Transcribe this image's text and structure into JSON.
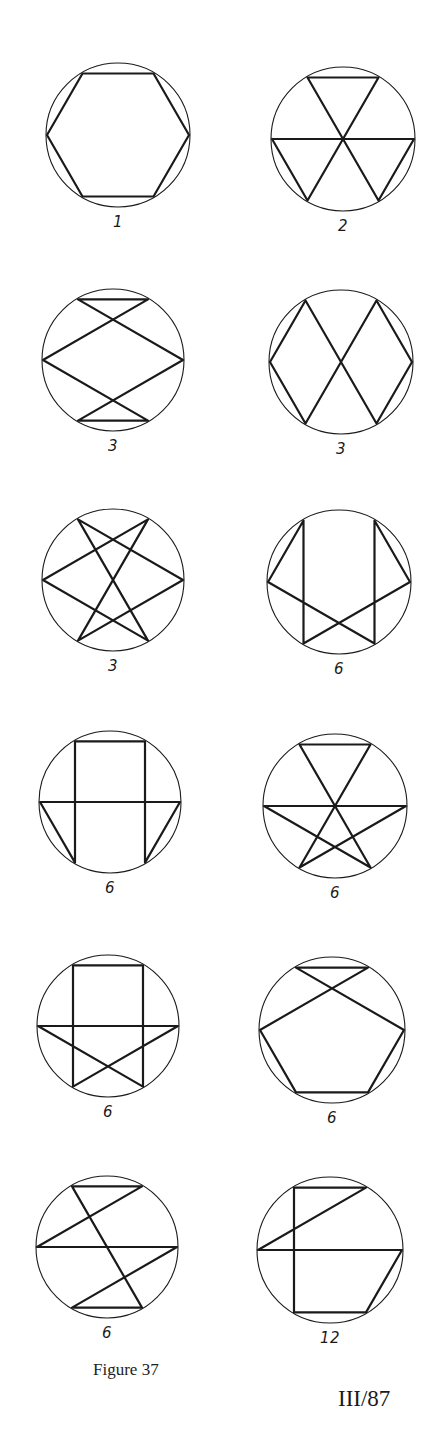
{
  "figure": {
    "caption": "Figure 37",
    "page_number": "III/87",
    "line_color": "#1a1a1a",
    "vertex_convention": "Vertices of inscribed regular hexagon: 0=right, 1=top-right, 2=top-left, 3=left, 4=bottom-left, 5=bottom-right",
    "diagrams": [
      {
        "label": "1",
        "cx": 118,
        "cy": 135,
        "r": 72,
        "path": [
          0,
          1,
          2,
          3,
          4,
          5,
          0
        ]
      },
      {
        "label": "2",
        "cx": 343,
        "cy": 139,
        "r": 72,
        "path": [
          3,
          0,
          5,
          2,
          1,
          4,
          3
        ]
      },
      {
        "label": "3",
        "cx": 113,
        "cy": 360,
        "r": 71,
        "path": [
          2,
          1,
          3,
          5,
          4,
          0,
          2
        ]
      },
      {
        "label": "3",
        "cx": 341,
        "cy": 362,
        "r": 72,
        "path": [
          2,
          3,
          4,
          1,
          0,
          5,
          2
        ]
      },
      {
        "label": "3",
        "cx": 113,
        "cy": 580,
        "r": 71,
        "path": [
          2,
          0,
          4,
          1,
          3,
          5,
          2
        ]
      },
      {
        "label": "6",
        "cx": 339,
        "cy": 582,
        "r": 72,
        "path": [
          2,
          3,
          5,
          1,
          0,
          4,
          2
        ]
      },
      {
        "label": "6",
        "cx": 110,
        "cy": 802,
        "r": 71,
        "path": [
          2,
          1,
          5,
          0,
          3,
          4,
          2
        ]
      },
      {
        "label": "6",
        "cx": 335,
        "cy": 806,
        "r": 72,
        "path": [
          2,
          1,
          4,
          0,
          3,
          5,
          2
        ]
      },
      {
        "label": "6",
        "cx": 108,
        "cy": 1026,
        "r": 71,
        "path": [
          2,
          1,
          5,
          3,
          0,
          4,
          2
        ]
      },
      {
        "label": "6",
        "cx": 332,
        "cy": 1030,
        "r": 73,
        "path": [
          2,
          1,
          3,
          4,
          5,
          0,
          2
        ]
      },
      {
        "label": "6",
        "cx": 107,
        "cy": 1247,
        "r": 71,
        "path": [
          2,
          1,
          3,
          0,
          4,
          5,
          2
        ]
      },
      {
        "label": "12",
        "cx": 330,
        "cy": 1250,
        "r": 73,
        "path": [
          2,
          1,
          3,
          0,
          5,
          4,
          2
        ]
      }
    ]
  }
}
